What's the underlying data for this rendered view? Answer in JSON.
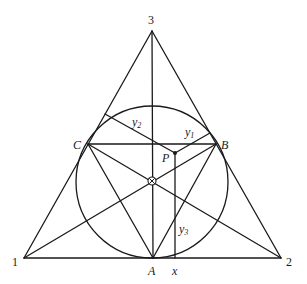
{
  "diagram": {
    "type": "geometry",
    "vertices": {
      "v1": {
        "label": "1",
        "x": 24,
        "y": 258
      },
      "v2": {
        "label": "2",
        "x": 281,
        "y": 258
      },
      "v3": {
        "label": "3",
        "x": 152,
        "y": 31
      }
    },
    "points": {
      "A": {
        "label": "A",
        "x": 153,
        "y": 258
      },
      "B": {
        "label": "B",
        "x": 216,
        "y": 144
      },
      "C": {
        "label": "C",
        "x": 88,
        "y": 144
      },
      "P": {
        "label": "P",
        "x": 175,
        "y": 153
      },
      "center": {
        "label": "⊗",
        "x": 152,
        "y": 181
      }
    },
    "circle": {
      "cx": 152,
      "cy": 182,
      "r": 76
    },
    "perpendiculars": {
      "y1": {
        "label": "y",
        "sub": "1",
        "from": [
          175,
          153
        ],
        "to": [
          210,
          133
        ]
      },
      "y2": {
        "label": "y",
        "sub": "2",
        "from": [
          175,
          153
        ],
        "to": [
          105,
          114
        ]
      },
      "y3": {
        "label": "y",
        "sub": "3",
        "from": [
          175,
          153
        ],
        "to": [
          175,
          258
        ]
      }
    },
    "axis_label": "x",
    "stroke_color": "#1a1a1a"
  }
}
